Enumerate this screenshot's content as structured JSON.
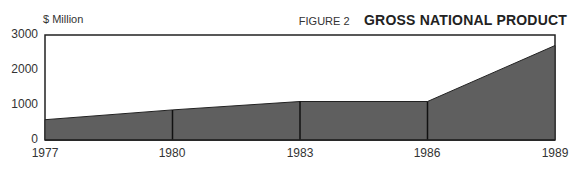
{
  "header": {
    "unit_label": "$ Million",
    "figure_number": "FIGURE 2",
    "title": "GROSS NATIONAL PRODUCT"
  },
  "y_ticks": [
    "3000",
    "2000",
    "1000",
    "0"
  ],
  "x_ticks": [
    "1977",
    "1980",
    "1983",
    "1986",
    "1989"
  ],
  "colors": {
    "fill": "#5f5f5f",
    "line": "#222222"
  },
  "chart_data": {
    "type": "area",
    "title": "GROSS NATIONAL PRODUCT",
    "subtitle": "FIGURE 2",
    "xlabel": "",
    "ylabel": "$ Million",
    "categories": [
      "1977",
      "1980",
      "1983",
      "1986",
      "1989"
    ],
    "values": [
      580,
      860,
      1100,
      1100,
      2700
    ],
    "ylim": [
      0,
      3000
    ],
    "yticks": [
      0,
      1000,
      2000,
      3000
    ],
    "grid": false,
    "legend": null
  }
}
